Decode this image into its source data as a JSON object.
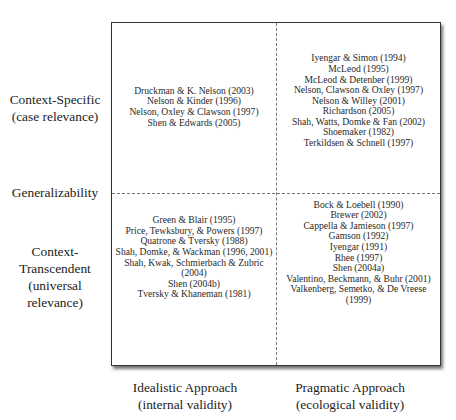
{
  "diagram": {
    "y_axis": {
      "top_label": [
        "Context-Specific",
        "(case relevance)"
      ],
      "middle_label": "Generalizability",
      "bottom_label": [
        "Context-",
        "Transcendent",
        "(universal",
        "relevance)"
      ]
    },
    "x_axis": {
      "left_label": [
        "Idealistic Approach",
        "(internal validity)"
      ],
      "right_label": [
        "Pragmatic Approach",
        "(ecological validity)"
      ]
    },
    "quadrants": {
      "top_left": [
        "Druckman & K. Nelson (2003)",
        "Nelson & Kinder (1996)",
        "Nelson, Oxley & Clawson (1997)",
        "Shen & Edwards (2005)"
      ],
      "top_right": [
        "Iyengar & Simon (1994)",
        "McLeod (1995)",
        "McLeod & Detenber (1999)",
        "Nelson, Clawson & Oxley (1997)",
        "Nelson & Willey (2001)",
        "Richardson (2005)",
        "Shah, Watts, Domke & Fan (2002)",
        "Shoemaker (1982)",
        "Terkildsen & Schnell (1997)"
      ],
      "bottom_left": [
        "Green & Blair (1995)",
        "Price, Tewksbury, & Powers (1997)",
        "Quatrone & Tversky (1988)",
        "Shah, Domke, & Wackman (1996, 2001)",
        "Shah, Kwak, Schmierbach & Zubric (2004)",
        "Shen (2004b)",
        "Tversky & Khaneman (1981)"
      ],
      "bottom_right": [
        "Bock & Loebell (1990)",
        "Brewer (2002)",
        "Cappella & Jamieson (1997)",
        "Gamson (1992)",
        "Iyengar (1991)",
        "Rhee (1997)",
        "Shen (2004a)",
        "Valentino, Beckmann, & Buhr (2001)",
        "Valkenberg, Semetko, & De Vreese (1999)"
      ]
    }
  }
}
